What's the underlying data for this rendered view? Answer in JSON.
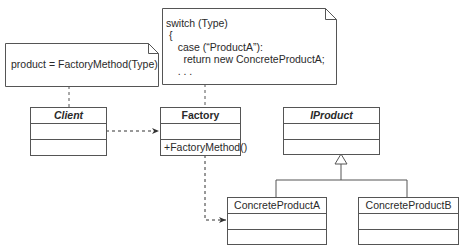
{
  "notes": {
    "client_note": {
      "text": "product = FactoryMethod(Type)"
    },
    "factory_note": {
      "lines": [
        "switch (Type)",
        " {",
        "    case (“ProductA”):",
        "      return new ConcreteProductA;",
        "    . . ."
      ]
    }
  },
  "classes": {
    "client": {
      "name": "Client",
      "attributes": "",
      "operations": ""
    },
    "factory": {
      "name": "Factory",
      "attributes": "",
      "operations": "+FactoryMethod()"
    },
    "iproduct": {
      "name": "IProduct",
      "attributes": "",
      "operations": ""
    },
    "concrete_a": {
      "name": "ConcreteProductA",
      "attributes": "",
      "operations": ""
    },
    "concrete_b": {
      "name": "ConcreteProductB",
      "attributes": "",
      "operations": ""
    }
  },
  "relationships": [
    {
      "from": "client",
      "to": "factory",
      "type": "dependency"
    },
    {
      "from": "factory",
      "to": "concrete_a",
      "type": "dependency"
    },
    {
      "from": "concrete_a",
      "to": "iproduct",
      "type": "realization"
    },
    {
      "from": "concrete_b",
      "to": "iproduct",
      "type": "realization"
    },
    {
      "from": "client_note",
      "to": "client",
      "type": "note-anchor"
    },
    {
      "from": "factory_note",
      "to": "factory",
      "type": "note-anchor"
    }
  ],
  "colors": {
    "line": "#555555",
    "text": "#2a2a2a"
  }
}
